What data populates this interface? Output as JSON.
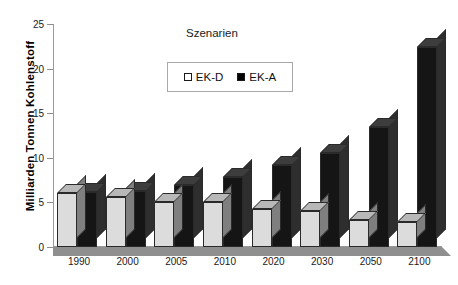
{
  "chart_data": {
    "type": "bar",
    "title": "",
    "legend_title": "Szenarien",
    "legend_position": "top-center",
    "xlabel": "",
    "ylabel": "Milliarden Tonnen Kohlenstoff",
    "categories": [
      "1990",
      "2000",
      "2005",
      "2010",
      "2020",
      "2030",
      "2050",
      "2100"
    ],
    "ylim": [
      0,
      25
    ],
    "yticks": [
      0,
      5,
      10,
      15,
      20,
      25
    ],
    "ytick_labels": [
      "0",
      "5",
      "10",
      "15",
      "20",
      "25"
    ],
    "grid": false,
    "series": [
      {
        "name": "EK-D",
        "color": "#dcdcdc",
        "values": [
          6.1,
          5.6,
          5.0,
          5.0,
          4.3,
          4.0,
          3.0,
          2.8
        ]
      },
      {
        "name": "EK-A",
        "color": "#151515",
        "values": [
          6.2,
          6.3,
          6.9,
          7.8,
          9.2,
          10.5,
          13.4,
          22.4
        ]
      }
    ]
  },
  "axis": {
    "y_title": "Milliarden Tonnen Kohlenstoff"
  },
  "legend": {
    "title": "Szenarien",
    "items": [
      {
        "label": "EK-D",
        "swatch": "light-square-icon"
      },
      {
        "label": "EK-A",
        "swatch": "dark-square-icon"
      }
    ]
  }
}
